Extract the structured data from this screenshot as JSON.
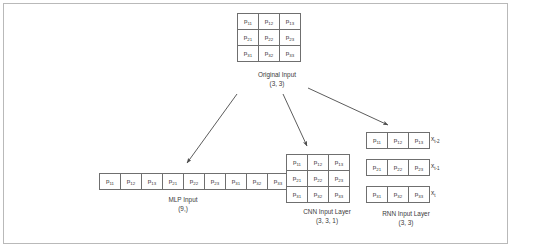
{
  "figure": {
    "original": {
      "caption": "Original Input\n(3, 3)",
      "rows": [
        [
          "p11",
          "p12",
          "p13"
        ],
        [
          "p21",
          "p22",
          "p23"
        ],
        [
          "p31",
          "p32",
          "p33"
        ]
      ]
    },
    "mlp": {
      "caption": "MLP Input\n(9,)",
      "cells": [
        "p11",
        "p12",
        "p13",
        "p21",
        "p22",
        "p23",
        "p31",
        "p32",
        "p33"
      ]
    },
    "cnn": {
      "caption": "CNN Input Layer\n(3, 3, 1)",
      "rows": [
        [
          "p11",
          "p12",
          "p13"
        ],
        [
          "p21",
          "p22",
          "p23"
        ],
        [
          "p31",
          "p32",
          "p33"
        ]
      ]
    },
    "rnn": {
      "caption": "RNN Input Layer\n(3, 3)",
      "rows": [
        [
          "p11",
          "p12",
          "p13"
        ],
        [
          "p21",
          "p22",
          "p23"
        ],
        [
          "p31",
          "p32",
          "p33"
        ]
      ],
      "timestep_labels": [
        "xt-2",
        "xt-1",
        "xt"
      ]
    },
    "colors": {
      "cell_border": "#6f6f6f",
      "frame_border": "#b9b9b9",
      "text": "#3a3a3a",
      "arrow": "#4a4a4a",
      "background": "#ffffff"
    }
  }
}
